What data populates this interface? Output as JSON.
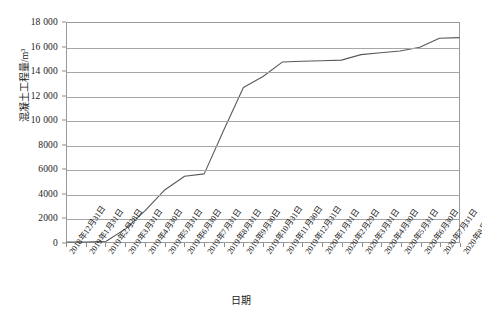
{
  "chart_data": {
    "type": "line",
    "title": "",
    "xlabel": "日期",
    "ylabel": "混凝土工程量/m³",
    "ylim": [
      0,
      18000
    ],
    "ytick_step": 2000,
    "grid": true,
    "legend": false,
    "line_color": "#595959",
    "categories": [
      "2018年12月31日",
      "2019年1月31日",
      "2019年2月28日",
      "2019年3月31日",
      "2019年4月30日",
      "2019年5月31日",
      "2019年6月30日",
      "2019年7月31日",
      "2019年8月31日",
      "2019年9月30日",
      "2019年10月31日",
      "2019年11月30日",
      "2019年12月31日",
      "2020年1月31日",
      "2020年2月29日",
      "2020年3月31日",
      "2020年4月30日",
      "2020年5月31日",
      "2020年6月30日",
      "2020年7月31日",
      "2020年8月31日"
    ],
    "ytick_labels": [
      "18 000",
      "16 000",
      "14 000",
      "12 000",
      "10 000",
      "8000",
      "6000",
      "4000",
      "2000",
      "0"
    ],
    "ytick_values": [
      18000,
      16000,
      14000,
      12000,
      10000,
      8000,
      6000,
      4000,
      2000,
      0
    ],
    "series": [
      {
        "name": "混凝土累计工程量",
        "values": [
          0,
          0,
          60,
          1100,
          2600,
          4300,
          5400,
          5600,
          9200,
          12700,
          13600,
          14800,
          14850,
          14900,
          14950,
          15400,
          15550,
          15700,
          16000,
          16750,
          16800
        ]
      }
    ]
  }
}
